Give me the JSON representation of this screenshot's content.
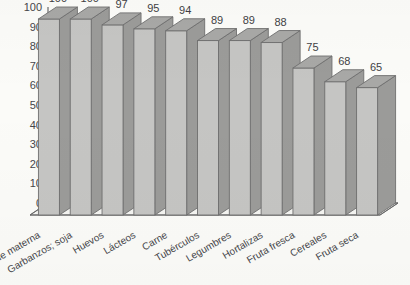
{
  "chart_data": {
    "type": "bar",
    "title": "",
    "subtitle": "",
    "xlabel": "",
    "ylabel": "",
    "ylim": [
      0,
      100
    ],
    "ytick_step": 10,
    "grid": false,
    "legend": false,
    "style": "3d-column",
    "categories": [
      "Leche materna",
      "Garbanzos; soja",
      "Huevos",
      "Lácteos",
      "Carne",
      "Tubérculos",
      "Legumbres",
      "Hortalizas",
      "Fruta fresca",
      "Cereales",
      "Fruta seca"
    ],
    "values": [
      100,
      100,
      97,
      95,
      94,
      89,
      89,
      88,
      75,
      68,
      65
    ],
    "value_labels": [
      "100",
      "100",
      "97",
      "95",
      "94",
      "89",
      "89",
      "88",
      "75",
      "68",
      "65"
    ],
    "ytick_labels": [
      "0",
      "10",
      "20",
      "30",
      "40",
      "50",
      "60",
      "70",
      "80",
      "90",
      "100"
    ],
    "colors": {
      "bar_front": "#c5c5c3",
      "bar_top": "#a8a8a6",
      "bar_side": "#9b9b99",
      "bar_outline": "#6f6f6f",
      "axis": "#6b6b6b",
      "floor": "#f4f4f1",
      "background": "#fbfbf8",
      "text": "#46464a"
    }
  }
}
